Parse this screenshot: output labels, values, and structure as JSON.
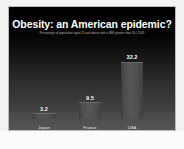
{
  "slide": {
    "title": "Obesity: an American epidemic?",
    "subtitle": "Percentage of population aged 15 and above with a BMI greater than 30 | 2005"
  },
  "colors": {
    "slide_background_top": "#000000",
    "slide_background_bottom": "#4c4c4c",
    "bar_fill": "#565656",
    "bar_highlight": "#6a6a6a",
    "title_text": "#ffffff",
    "subtitle_text": "#b9b9b9",
    "label_text": "#e8e8e8",
    "page_background": "#f2f2f0",
    "slide_border": "#b9b9b6"
  },
  "chart_data": {
    "type": "bar",
    "title": "Obesity: an American epidemic?",
    "subtitle": "Percentage of population aged 15 and above with a BMI greater than 30 | 2005",
    "xlabel": "",
    "ylabel": "",
    "categories": [
      "Japan",
      "France",
      "USA"
    ],
    "values": [
      3.2,
      9.5,
      32.2
    ],
    "value_labels": [
      "3.2",
      "9.5",
      "32.2"
    ],
    "ylim": [
      0,
      36
    ],
    "grid": false,
    "legend": false,
    "axis_visible": false,
    "series": [
      {
        "name": "Obesity rate (%)",
        "values": [
          3.2,
          9.5,
          32.2
        ]
      }
    ]
  }
}
